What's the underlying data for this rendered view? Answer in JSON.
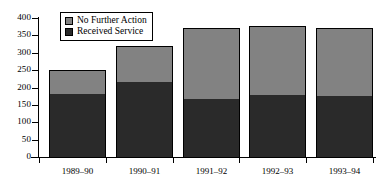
{
  "chart_data": {
    "type": "bar",
    "subtype": "stacked-bar",
    "title": "",
    "subtitle": "",
    "xlabel": "",
    "ylabel": "",
    "categories": [
      "1989–90",
      "1990–91",
      "1991–92",
      "1992–93",
      "1993–94"
    ],
    "series": [
      {
        "name": "Received Service",
        "color": "#2a2a2a",
        "values": [
          180,
          215,
          168,
          178,
          175
        ]
      },
      {
        "name": "No Further Action",
        "color": "#828282",
        "values": [
          70,
          105,
          202,
          200,
          195
        ]
      }
    ],
    "totals": [
      250,
      320,
      370,
      378,
      370
    ],
    "ylim": [
      0,
      400
    ],
    "ytick_values": [
      0,
      50,
      100,
      150,
      200,
      250,
      300,
      350,
      400
    ],
    "ytick_labels": [
      "0",
      "50",
      "100",
      "150",
      "200",
      "250",
      "300",
      "350",
      "400"
    ],
    "grid": false,
    "legend_position": "top-left-inside",
    "legend_entries": [
      {
        "label": "No Further Action",
        "color": "#828282"
      },
      {
        "label": "Received Service",
        "color": "#2a2a2a"
      }
    ]
  },
  "colors": {
    "no_further_action": "#828282",
    "received_service": "#2a2a2a",
    "axis": "#000000",
    "background": "#ffffff"
  }
}
